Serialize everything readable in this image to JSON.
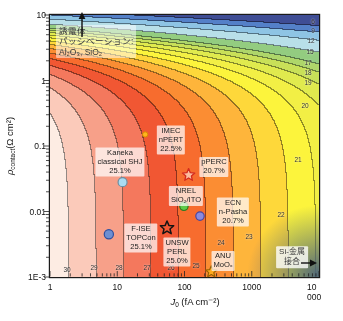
{
  "chart_data": {
    "type": "heatmap",
    "subtype": "efficiency-contour-map",
    "title": "",
    "xlabel": {
      "prefix": "J",
      "sub": "0",
      "suffix": " (fA cm⁻²)"
    },
    "ylabel": {
      "prefix": "ρ",
      "sub": "contact",
      "suffix": "(Ω cm²)"
    },
    "x_axis": {
      "scale": "log",
      "min": 1,
      "max": 10000,
      "tick_values": [
        1,
        10,
        100,
        1000,
        10000
      ],
      "tick_labels": [
        "1",
        "10",
        "100",
        "1000",
        "10 000"
      ]
    },
    "y_axis": {
      "scale": "log",
      "min": 0.001,
      "max": 10,
      "tick_values": [
        10,
        1,
        0.1,
        0.01,
        0.001
      ],
      "tick_labels": [
        "10",
        "1",
        "0.1",
        "0.01",
        "1E-3"
      ]
    },
    "efficiency_model": {
      "base": 30.7,
      "j0_slope": 2.45,
      "rho_coeff": 2.2
    },
    "contour_levels": [
      6,
      9,
      12,
      15,
      17,
      18,
      19,
      20,
      21,
      22,
      23,
      24,
      25,
      26,
      27,
      28,
      29,
      30
    ],
    "band_colors": [
      "#3f4d95",
      "#5480c8",
      "#8ec4e4",
      "#b8dfe8",
      "#93cc80",
      "#aed66a",
      "#c9e058",
      "#e0ea4e",
      "#f2ef45",
      "#fcf43c",
      "#fed83a",
      "#feb53b",
      "#fb8d33",
      "#f76c2e",
      "#f15733",
      "#f4785d",
      "#f7a089",
      "#fbcaba",
      "#fdece3"
    ],
    "contour_line_darken": 0.58,
    "si_metal_shade": "#48617a",
    "contour_labels": [
      {
        "text": "6",
        "x": 313,
        "y": 21
      },
      {
        "text": "9",
        "x": 313,
        "y": 30
      },
      {
        "text": "12",
        "x": 311,
        "y": 40
      },
      {
        "text": "15",
        "x": 310,
        "y": 51
      },
      {
        "text": "17",
        "x": 308,
        "y": 62
      },
      {
        "text": "18",
        "x": 308,
        "y": 72
      },
      {
        "text": "19",
        "x": 308,
        "y": 82
      },
      {
        "text": "20",
        "x": 305,
        "y": 105
      },
      {
        "text": "21",
        "x": 298,
        "y": 159
      },
      {
        "text": "22",
        "x": 281,
        "y": 214
      },
      {
        "text": "23",
        "x": 249,
        "y": 236
      },
      {
        "text": "24",
        "x": 221,
        "y": 242
      },
      {
        "text": "25",
        "x": 196,
        "y": 265
      },
      {
        "text": "26",
        "x": 171,
        "y": 267
      },
      {
        "text": "27",
        "x": 147,
        "y": 267
      },
      {
        "text": "28",
        "x": 119,
        "y": 267
      },
      {
        "text": "29",
        "x": 94,
        "y": 267
      },
      {
        "text": "30",
        "x": 67,
        "y": 269
      }
    ],
    "points": [
      {
        "id": "kaneka-classical-shj",
        "label": [
          "Kaneka",
          "classical SHJ",
          "25.1%"
        ],
        "marker": "circle",
        "r": 4.5,
        "fill": "#aadcf2",
        "stroke": "#6b8fa3",
        "sw": 1.2,
        "j0": 12,
        "rho": 0.028,
        "label_cx": 120,
        "label_cy": 162
      },
      {
        "id": "imec-npert",
        "label": [
          "IMEC",
          "nPERT",
          "22.5%"
        ],
        "marker": "circle",
        "r": 2.6,
        "fill": "#ffb41e",
        "stroke": "#d98a00",
        "sw": 1,
        "j0": 26,
        "rho": 0.15,
        "label_cx": 171,
        "label_cy": 140
      },
      {
        "id": "nrel-sio2-ito",
        "label": [
          "NREL",
          "SiO₂/ITO"
        ],
        "marker": "circle",
        "r": 4.2,
        "fill": "#5ecb49",
        "stroke": "#2f7a22",
        "sw": 1.2,
        "j0": 98,
        "rho": 0.012,
        "label_cx": 186,
        "label_cy": 196
      },
      {
        "id": "pperc",
        "label": [
          "pPERC",
          "20.7%"
        ],
        "marker": "star",
        "r": 6.5,
        "fill": "rgba(255,255,255,0.55)",
        "stroke": "#d42a1e",
        "sw": 1.3,
        "j0": 115,
        "rho": 0.036,
        "label_cx": 214,
        "label_cy": 167
      },
      {
        "id": "ecn-n-pasha",
        "label": [
          "ECN",
          "n-Pasha",
          "20.7%"
        ],
        "marker": "circle",
        "r": 4.2,
        "fill": "#8a8ade",
        "stroke": "#4646a0",
        "sw": 1.2,
        "j0": 170,
        "rho": 0.0085,
        "label_cx": 233,
        "label_cy": 212
      },
      {
        "id": "f-ise-topcon",
        "label": [
          "F-ISE",
          "TOPCon",
          "25.1%"
        ],
        "marker": "circle",
        "r": 4.6,
        "fill": "#6f8fd2",
        "stroke": "#2f4f9f",
        "sw": 1.2,
        "j0": 7.5,
        "rho": 0.0045,
        "label_cx": 141,
        "label_cy": 238
      },
      {
        "id": "unsw-perl",
        "label": [
          "UNSW",
          "PERL",
          "25.0%"
        ],
        "marker": "star",
        "r": 7,
        "fill": "none",
        "stroke": "#141414",
        "sw": 1.5,
        "j0": 55,
        "rho": 0.0056,
        "label_cx": 177,
        "label_cy": 252
      },
      {
        "id": "anu-moox",
        "label": [
          "ANU",
          "MoOₓ"
        ],
        "marker": "star",
        "r": 6,
        "fill": "#ffaa1e",
        "stroke": "#9a6000",
        "sw": 1.2,
        "j0": 250,
        "rho": 0.0012,
        "label_cx": 223,
        "label_cy": 261
      }
    ],
    "annotations": [
      {
        "id": "dielectric-passivation",
        "lines": [
          "誘電体",
          "パッシベーション:",
          "Al₂O₃, SiO₂"
        ],
        "x": 56,
        "y": 25,
        "anchor": "tl",
        "align": "left",
        "bg": 0.5,
        "fs": 8.5
      },
      {
        "id": "si-metal-contact",
        "lines": [
          "Si-金属",
          "接合"
        ],
        "x": 292,
        "y": 257,
        "anchor": "c",
        "align": "center",
        "bg": 0.8,
        "fs": 8
      }
    ],
    "arrows": [
      {
        "id": "passivation-up-arrow",
        "x1": 82,
        "y1": 37,
        "x2": 82,
        "y2": 12
      },
      {
        "id": "si-metal-right-arrow",
        "x1": 301,
        "y1": 263,
        "x2": 317,
        "y2": 263
      }
    ]
  }
}
